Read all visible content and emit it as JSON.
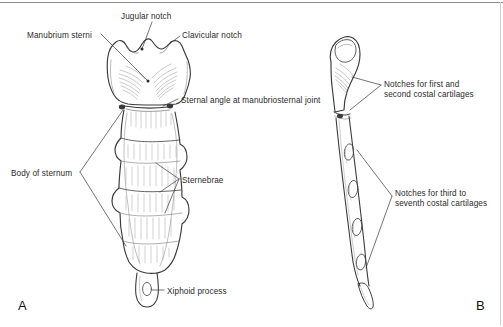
{
  "figure": {
    "kind": "anatomical-line-drawing",
    "subject": "sternum",
    "background_color": "#ffffff",
    "ink_color": "#2a2a2a",
    "hatch_color": "#9a9a9a"
  },
  "panels": [
    {
      "id": "A",
      "label": "A",
      "view": "anterior",
      "x": 18,
      "y": 298
    },
    {
      "id": "B",
      "label": "B",
      "view": "lateral",
      "x": 476,
      "y": 298
    }
  ],
  "labels": [
    {
      "id": "manubrium-sterni",
      "text": "Manubrium sterni",
      "x": 27,
      "y": 31,
      "align": "left"
    },
    {
      "id": "jugular-notch",
      "text": "Jugular notch",
      "x": 121,
      "y": 12,
      "align": "left"
    },
    {
      "id": "clavicular-notch",
      "text": "Clavicular notch",
      "x": 182,
      "y": 31,
      "align": "left"
    },
    {
      "id": "sternal-angle",
      "text": "Sternal angle at manubriosternal joint",
      "x": 181,
      "y": 96,
      "align": "left"
    },
    {
      "id": "body-of-sternum",
      "text": "Body of sternum",
      "x": 11,
      "y": 169,
      "align": "left"
    },
    {
      "id": "sternebrae",
      "text": "Sternebrae",
      "x": 182,
      "y": 176,
      "align": "left"
    },
    {
      "id": "xiphoid-process",
      "text": "Xiphoid process",
      "x": 167,
      "y": 287,
      "align": "left"
    },
    {
      "id": "notches-first-second",
      "text": "Notches for first and\nsecond costal cartilages",
      "x": 384,
      "y": 80,
      "align": "left"
    },
    {
      "id": "notches-third-seventh",
      "text": "Notches for third to\nseventh costal cartilages",
      "x": 395,
      "y": 189,
      "align": "left"
    }
  ],
  "structures": {
    "anterior": {
      "manubrium": "broad quadrangular upper bone with central jugular notch and paired clavicular notches",
      "body": "elongated sternum body divided into four sternebrae by transverse ridges, scalloped lateral costal margins",
      "sternebrae_count": 4,
      "xiphoid": "small tapering process with an oval foramen at the inferior end"
    },
    "lateral": {
      "manubrium": "tilted upper segment with rounded clavicular facet",
      "sternal_angle": "angulation at the manubriosternal joint",
      "costal_notches_visible": 4
    }
  }
}
